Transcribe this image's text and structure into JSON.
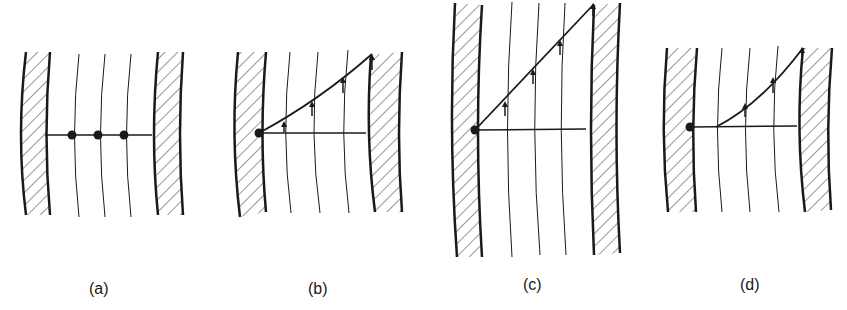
{
  "figure": {
    "panels": [
      {
        "id": "a",
        "label": "(a)",
        "description": "Three fluid particles (dots) on a horizontal line between two curved hatched walls"
      },
      {
        "id": "b",
        "label": "(b)",
        "description": "Line deformed with upward velocity arrows increasing toward right wall"
      },
      {
        "id": "c",
        "label": "(c)",
        "description": "Larger domain; straight sloped line with arrows from left-wall point to right wall"
      },
      {
        "id": "d",
        "label": "(d)",
        "description": "Sloped line starting from first streamline, arrows on inner streamlines"
      }
    ],
    "colors": {
      "ink": "#1a1a1a",
      "background": "#ffffff"
    }
  }
}
